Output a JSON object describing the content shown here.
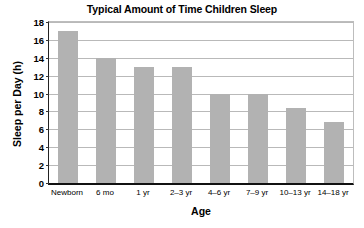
{
  "chart_data": {
    "type": "bar",
    "title": "Typical Amount of Time Children Sleep",
    "xlabel": "Age",
    "ylabel": "Sleep per Day (h)",
    "categories": [
      "Newborn",
      "6 mo",
      "1 yr",
      "2–3 yr",
      "4–6 yr",
      "7–9 yr",
      "10–13 yr",
      "14–18 yr"
    ],
    "values": [
      17,
      14,
      13,
      13,
      10,
      10,
      8.4,
      6.8
    ],
    "ylim": [
      0,
      18
    ],
    "ytick_values": [
      0,
      2,
      4,
      6,
      8,
      10,
      12,
      14,
      16,
      18
    ],
    "ytick_labels": [
      "0",
      "2",
      "4",
      "6",
      "8",
      "10",
      "12",
      "14",
      "16",
      "18"
    ],
    "grid": "horizontal",
    "legend": "none",
    "bar_color": "#b2b2b2",
    "background_color": "#ffffff",
    "axis_color": "#111111",
    "gridline_color": "#b9b9b9"
  }
}
